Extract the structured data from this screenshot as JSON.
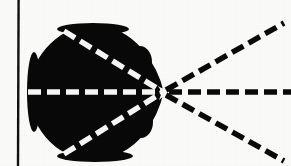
{
  "figure": {
    "width": 291,
    "height": 166,
    "background_color": "#fbfbfa",
    "ink_color": "#0a0a0a",
    "highlight_color": "#f7f7f5"
  },
  "axis_line": {
    "label": "vertical reference line",
    "x": 18,
    "y_top": 0,
    "y_bottom": 166,
    "thickness": 2.4,
    "color": "#111111"
  },
  "blob": {
    "label": "solid black cardioid region",
    "fill_color": "#090909",
    "center_x": 93,
    "center_y": 92,
    "radius_x": 63,
    "radius_y": 66,
    "top_y": 26,
    "bottom_y": 159,
    "left_x": 30,
    "right_x": 163
  },
  "vertex": {
    "label": "ray convergence point",
    "x": 163,
    "y": 92,
    "marker_color": "#f7f7f5",
    "marker_size": 8
  },
  "rays": {
    "dash_pattern": "13 6",
    "stroke_width": 5.5,
    "inside_color": "#f7f7f5",
    "outside_color": "#0a0a0a",
    "items": [
      {
        "name": "upper-incoming-ray",
        "segment": "inside-blob",
        "color": "#f7f7f5",
        "from_x": 64,
        "from_y": 31,
        "to_x": 163,
        "to_y": 92,
        "angle_deg": -31.6
      },
      {
        "name": "axis-incoming-ray",
        "segment": "inside-blob",
        "color": "#f7f7f5",
        "from_x": 30,
        "from_y": 92,
        "to_x": 163,
        "to_y": 92,
        "angle_deg": 0
      },
      {
        "name": "lower-incoming-ray",
        "segment": "inside-blob",
        "color": "#f7f7f5",
        "from_x": 64,
        "from_y": 154,
        "to_x": 163,
        "to_y": 92,
        "angle_deg": 32.1
      },
      {
        "name": "upper-outgoing-ray",
        "segment": "outside-blob",
        "color": "#0a0a0a",
        "from_x": 166,
        "from_y": 90,
        "to_x": 282,
        "to_y": 24,
        "angle_deg": -29.6
      },
      {
        "name": "axis-outgoing-ray",
        "segment": "outside-blob",
        "color": "#0a0a0a",
        "from_x": 168,
        "from_y": 92,
        "to_x": 291,
        "to_y": 92,
        "angle_deg": 0
      },
      {
        "name": "lower-outgoing-ray",
        "segment": "outside-blob",
        "color": "#0a0a0a",
        "from_x": 166,
        "from_y": 95,
        "to_x": 282,
        "to_y": 160,
        "angle_deg": 29.3
      }
    ]
  }
}
